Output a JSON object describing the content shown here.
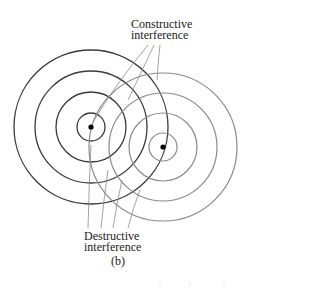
{
  "figure": {
    "panel_label": "(b)",
    "constructive_label": {
      "line1": "Constructive",
      "line2": "interference"
    },
    "destructive_label": {
      "line1": "Destructive",
      "line2": "interference"
    }
  },
  "sources": [
    {
      "name": "left-source",
      "cx": 91,
      "cy": 127,
      "radii": [
        14,
        35,
        56,
        77
      ],
      "color": "#3a3a3a"
    },
    {
      "name": "right-source",
      "cx": 163,
      "cy": 147,
      "radii": [
        14,
        34,
        54,
        74
      ],
      "color": "#8a8a8a"
    }
  ],
  "colors": {
    "background": "#ffffff",
    "text": "#222222",
    "leader": "#8a8a8a",
    "dot": "#000000"
  }
}
